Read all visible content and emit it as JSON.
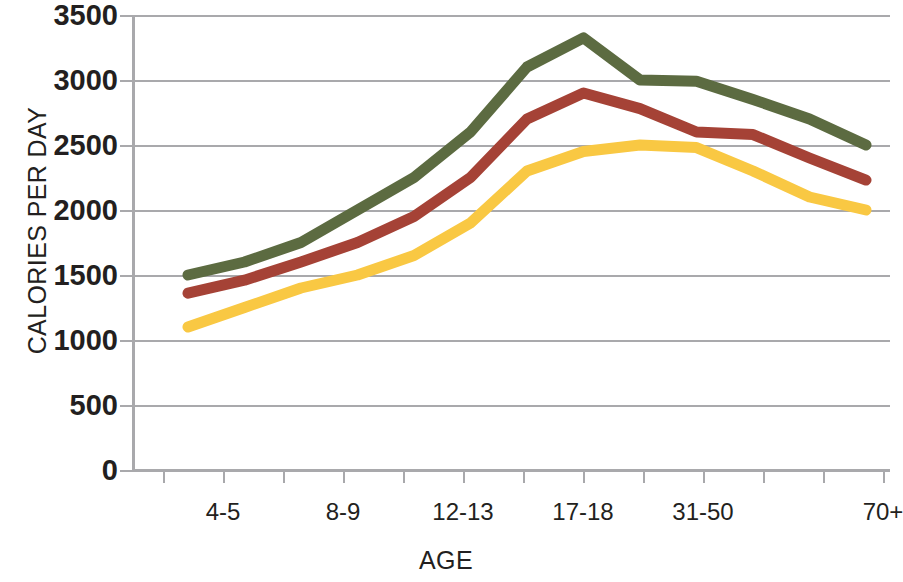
{
  "chart_data": {
    "type": "line",
    "title": "",
    "xlabel": "AGE",
    "ylabel": "CALORIES PER DAY",
    "ylim": [
      0,
      3500
    ],
    "ytick_values": [
      0,
      500,
      1000,
      1500,
      2000,
      2500,
      3000,
      3500
    ],
    "ytick_labels": [
      "0",
      "500",
      "1000",
      "1500",
      "2000",
      "2500",
      "3000",
      "3500"
    ],
    "grid": "horizontal",
    "legend": "none",
    "xtick_count": 13,
    "categories": [
      "2-3",
      "4-5",
      "6-7",
      "8-9",
      "10-11",
      "12-13",
      "14-16",
      "17-18",
      "19-30",
      "31-50",
      "51-60",
      "61-70",
      "70+"
    ],
    "xtick_labels_shown": [
      {
        "label": "4-5",
        "x_index": 1
      },
      {
        "label": "8-9",
        "x_index": 3
      },
      {
        "label": "12-13",
        "x_index": 5
      },
      {
        "label": "17-18",
        "x_index": 7
      },
      {
        "label": "31-50",
        "x_index": 9
      },
      {
        "label": "70+",
        "x_index": 12
      }
    ],
    "series": [
      {
        "name": "upper",
        "color": "#5c6b41",
        "values": [
          1500,
          1600,
          1750,
          2000,
          2250,
          2600,
          3100,
          3325,
          3000,
          2990,
          2850,
          2700,
          2500
        ]
      },
      {
        "name": "middle",
        "color": "#a54236",
        "values": [
          1360,
          1460,
          1600,
          1750,
          1950,
          2250,
          2700,
          2900,
          2780,
          2600,
          2580,
          2400,
          2230
        ]
      },
      {
        "name": "lower",
        "color": "#f9c843",
        "values": [
          1100,
          1250,
          1400,
          1500,
          1650,
          1900,
          2300,
          2450,
          2500,
          2480,
          2300,
          2100,
          2000
        ]
      }
    ],
    "style": {
      "line_width": 11,
      "grid_color": "#a9a9ac",
      "axis_color": "#a9a9ac",
      "text_color": "#231f20",
      "background": "#ffffff"
    }
  }
}
